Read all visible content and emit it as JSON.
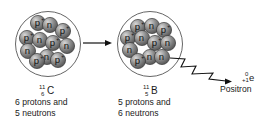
{
  "diagram": {
    "colors": {
      "particle_fill": "#8c8c8c",
      "particle_highlight": "#d8d8d8",
      "particle_stroke": "#3a3a3a",
      "nucleus_outline": "#555555",
      "text": "#1a1a1a"
    },
    "left_nucleus": {
      "mass_number": "11",
      "atomic_number": "6",
      "symbol": "C",
      "description_line1": "6 protons and",
      "description_line2": "5 neutrons",
      "particles": [
        {
          "type": "p",
          "label": "p",
          "charge": "+",
          "x": 38,
          "y": 23
        },
        {
          "type": "n",
          "label": "n",
          "charge": "",
          "x": 50,
          "y": 25
        },
        {
          "type": "p",
          "label": "p",
          "charge": "+",
          "x": 63,
          "y": 31
        },
        {
          "type": "p",
          "label": "p",
          "charge": "+",
          "x": 27,
          "y": 38
        },
        {
          "type": "n",
          "label": "n",
          "charge": "",
          "x": 40,
          "y": 40
        },
        {
          "type": "p",
          "label": "p",
          "charge": "+",
          "x": 53,
          "y": 43
        },
        {
          "type": "n",
          "label": "n",
          "charge": "",
          "x": 67,
          "y": 46
        },
        {
          "type": "n",
          "label": "n",
          "charge": "",
          "x": 28,
          "y": 51
        },
        {
          "type": "n",
          "label": "n",
          "charge": "",
          "x": 47,
          "y": 57
        },
        {
          "type": "p",
          "label": "p",
          "charge": "+",
          "x": 58,
          "y": 60
        },
        {
          "type": "p",
          "label": "p",
          "charge": "+",
          "x": 37,
          "y": 61
        }
      ]
    },
    "right_nucleus": {
      "mass_number": "11",
      "atomic_number": "5",
      "symbol": "B",
      "description_line1": "5 protons and",
      "description_line2": "6 neutrons",
      "particles": [
        {
          "type": "p",
          "label": "p",
          "charge": "+",
          "x": 138,
          "y": 27
        },
        {
          "type": "n",
          "label": "n",
          "charge": "",
          "x": 152,
          "y": 26
        },
        {
          "type": "p",
          "label": "p",
          "charge": "+",
          "x": 164,
          "y": 30
        },
        {
          "type": "p",
          "label": "p",
          "charge": "+",
          "x": 128,
          "y": 38
        },
        {
          "type": "n",
          "label": "n",
          "charge": "",
          "x": 142,
          "y": 38
        },
        {
          "type": "p",
          "label": "p",
          "charge": "+",
          "x": 155,
          "y": 43
        },
        {
          "type": "n",
          "label": "n",
          "charge": "",
          "x": 168,
          "y": 43
        },
        {
          "type": "n",
          "label": "n",
          "charge": "",
          "x": 130,
          "y": 50
        },
        {
          "type": "n",
          "label": "n",
          "charge": "",
          "x": 150,
          "y": 57
        },
        {
          "type": "n",
          "label": "n",
          "charge": "",
          "x": 162,
          "y": 57
        },
        {
          "type": "p",
          "label": "p",
          "charge": "+",
          "x": 138,
          "y": 61
        }
      ]
    },
    "reaction_arrow": {
      "from_x": 83,
      "to_x": 112,
      "y": 43
    },
    "emission": {
      "particle_name": "Positron",
      "mass_number": "0",
      "charge_number": "+1",
      "symbol": "e"
    }
  }
}
